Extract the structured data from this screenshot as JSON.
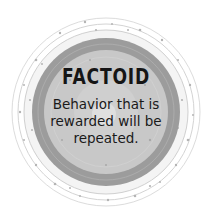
{
  "factoid": {
    "title": "FACTOID",
    "lines": [
      "Behavior that is",
      "rewarded will be",
      "repeated."
    ]
  },
  "colors": {
    "background": "#ffffff",
    "outer_ring_line": "#d8d8d8",
    "outer_dots": "#b8b8b8",
    "dark_band": "#9a9a9a",
    "inner_disc": "#c6c6c6",
    "inner_highlight": "#d6d6d6",
    "text": "#151515"
  }
}
